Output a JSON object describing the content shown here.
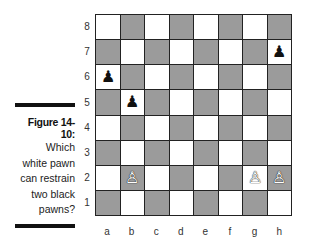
{
  "caption": {
    "title": "Figure 14-10:",
    "lines": [
      "Which",
      "white pawn",
      "can restrain",
      "two black",
      "pawns?"
    ]
  },
  "board": {
    "ranks": [
      "8",
      "7",
      "6",
      "5",
      "4",
      "3",
      "2",
      "1"
    ],
    "files": [
      "a",
      "b",
      "c",
      "d",
      "e",
      "f",
      "g",
      "h"
    ],
    "colors": {
      "light": "#ffffff",
      "dark": "#9b9b9b"
    },
    "pieces": [
      {
        "square": "h7",
        "type": "pawn",
        "color": "black",
        "glyph": "♟"
      },
      {
        "square": "a6",
        "type": "pawn",
        "color": "black",
        "glyph": "♟"
      },
      {
        "square": "b5",
        "type": "pawn",
        "color": "black",
        "glyph": "♟"
      },
      {
        "square": "b2",
        "type": "pawn",
        "color": "white",
        "glyph": "♙"
      },
      {
        "square": "g2",
        "type": "pawn",
        "color": "white",
        "glyph": "♙"
      },
      {
        "square": "h2",
        "type": "pawn",
        "color": "white",
        "glyph": "♙"
      }
    ]
  }
}
